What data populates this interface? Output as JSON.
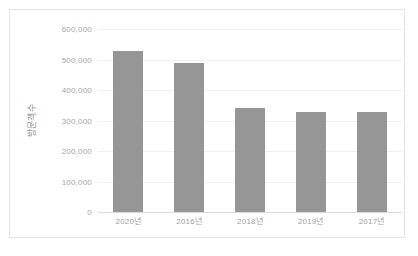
{
  "chart_data": {
    "type": "bar",
    "title": "",
    "xlabel": "",
    "ylabel": "방문객수",
    "categories": [
      "2020년",
      "2016년",
      "2018년",
      "2019년",
      "2017년"
    ],
    "values": [
      528000,
      489000,
      341000,
      328000,
      328000
    ],
    "ylim": [
      0,
      600000
    ],
    "ytick_values": [
      0,
      100000,
      200000,
      300000,
      400000,
      500000,
      600000
    ],
    "ytick_labels": [
      "0",
      "100,000",
      "200,000",
      "300,000",
      "400,000",
      "500,000",
      "600,000"
    ],
    "grid": true,
    "legend": false,
    "legend_position": "none",
    "series": [
      {
        "name": "방문객수",
        "values": [
          528000,
          489000,
          341000,
          328000,
          328000
        ]
      }
    ],
    "colors": {
      "bar": "#969696",
      "gridline": "#f0f0f0",
      "baseline": "#d9d9d9",
      "frame_border": "#e3e3e3",
      "tick_label": "#a6a6a6",
      "axis_title": "#8f8f8f",
      "background": "#ffffff"
    }
  }
}
